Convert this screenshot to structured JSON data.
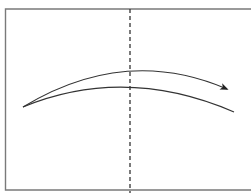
{
  "diagram": {
    "type": "origami-fold-diagram",
    "colors": {
      "background": "#ffffff",
      "frame": "#7a7a7a",
      "line": "#333333",
      "arrow": "#222222"
    },
    "paper_frame": {
      "x": 5,
      "y": 9,
      "right": 256,
      "bottom": 190
    },
    "fold_line": {
      "style": "dashed",
      "x": 130,
      "y1": 9,
      "y2": 193
    },
    "arrow": {
      "kind": "fold-arrow",
      "path": "M23 107 Q 125 45 229 90",
      "head_tip": [
        229,
        90
      ]
    },
    "flap_edge": {
      "path": "M23 107 Q 125 65 234 112"
    }
  }
}
